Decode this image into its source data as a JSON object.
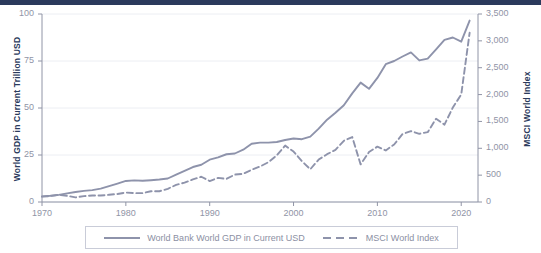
{
  "chart_data": {
    "type": "line",
    "title": "",
    "xlabel": "",
    "grid": true,
    "legend_position": "bottom",
    "x": [
      1970,
      1971,
      1972,
      1973,
      1974,
      1975,
      1976,
      1977,
      1978,
      1979,
      1980,
      1981,
      1982,
      1983,
      1984,
      1985,
      1986,
      1987,
      1988,
      1989,
      1990,
      1991,
      1992,
      1993,
      1994,
      1995,
      1996,
      1997,
      1998,
      1999,
      2000,
      2001,
      2002,
      2003,
      2004,
      2005,
      2006,
      2007,
      2008,
      2009,
      2010,
      2011,
      2012,
      2013,
      2014,
      2015,
      2016,
      2017,
      2018,
      2019,
      2020,
      2021
    ],
    "xticks": [
      1970,
      1980,
      1990,
      2000,
      2010,
      2020
    ],
    "xlim": [
      1970,
      2022
    ],
    "axes": [
      {
        "id": "left",
        "label": "World GDP in Current Trillion USD",
        "ticks": [
          0,
          25,
          50,
          75,
          100
        ],
        "ticklabels": [
          "0",
          "25",
          "50",
          "75",
          "100"
        ],
        "lim": [
          0,
          100
        ]
      },
      {
        "id": "right",
        "label": "MSCI World Index",
        "ticks": [
          0,
          500,
          1000,
          1500,
          2000,
          2500,
          3000,
          3500
        ],
        "ticklabels": [
          "0",
          "500",
          "1,000",
          "1,500",
          "2,000",
          "2,500",
          "3,000",
          "3,500"
        ],
        "lim": [
          0,
          3500
        ]
      }
    ],
    "series": [
      {
        "name": "World Bank World GDP in Current USD",
        "axis": "left",
        "style": "solid",
        "color": "#8e93ab",
        "ylabel": "World GDP in Current Trillion USD",
        "values": [
          3.0,
          3.3,
          3.8,
          4.6,
          5.3,
          5.9,
          6.3,
          7.1,
          8.4,
          9.8,
          11.2,
          11.5,
          11.3,
          11.6,
          12.0,
          12.5,
          14.6,
          16.6,
          18.6,
          19.8,
          22.5,
          23.7,
          25.4,
          25.8,
          27.8,
          31.0,
          31.6,
          31.6,
          31.9,
          33.0,
          33.8,
          33.4,
          34.8,
          39.0,
          43.8,
          47.5,
          51.5,
          57.8,
          63.5,
          60.2,
          66.0,
          73.3,
          75.0,
          77.4,
          79.6,
          75.3,
          76.3,
          81.2,
          86.2,
          87.5,
          85.3,
          96.5
        ]
      },
      {
        "name": "MSCI World Index",
        "axis": "right",
        "style": "dashed",
        "color": "#8e93ab",
        "ylabel": "MSCI World Index",
        "values": [
          100,
          110,
          135,
          115,
          85,
          110,
          120,
          120,
          135,
          150,
          175,
          165,
          165,
          200,
          200,
          245,
          320,
          360,
          420,
          470,
          390,
          450,
          430,
          510,
          525,
          600,
          660,
          740,
          870,
          1050,
          940,
          760,
          610,
          790,
          890,
          970,
          1140,
          1210,
          700,
          930,
          1030,
          960,
          1070,
          1265,
          1320,
          1270,
          1300,
          1550,
          1440,
          1760,
          2000,
          3150
        ]
      }
    ]
  },
  "legend": {
    "items": [
      {
        "label": "World Bank World GDP in Current USD",
        "style": "solid"
      },
      {
        "label": "MSCI World Index",
        "style": "dashed"
      }
    ]
  },
  "colors": {
    "line": "#8e93ab",
    "axis": "#9094a6",
    "grid": "#eceef3",
    "axis_title": "#2b3a5c",
    "top_bar": "#2b3a5c",
    "legend_border": "#c9ccd8",
    "background": "#ffffff"
  }
}
